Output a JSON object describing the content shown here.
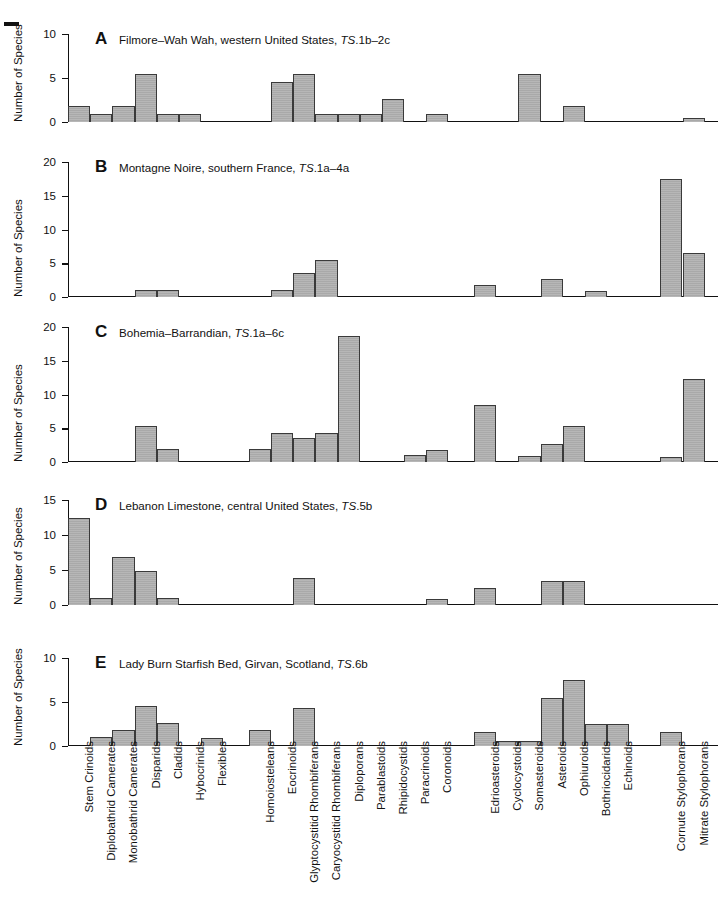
{
  "figure": {
    "axis_label": "Number of Species",
    "bar_color": "#a9a9a9",
    "bar_border_color": "#3a3a3a",
    "axis_color": "#111111"
  },
  "categories": [
    "Stem Crinoids",
    "Diplobathrid Camerates",
    "Monobathrid Camerates",
    "Disparids",
    "Cladids",
    "Hybocrinids",
    "Flexibles",
    "Homoiosteleans",
    "Eocrinoids",
    "Glyptocystitid Rhombiferans",
    "Caryocystitid Rhombiferans",
    "Diploporans",
    "Parablastoids",
    "Rhipidocystids",
    "Paracrinoids",
    "Coronoids",
    "Edrioasteroids",
    "Cyclocystoids",
    "Somasteroids",
    "Asteroids",
    "Ophiuroids",
    "Bothriocidarids",
    "Echinoids",
    "Cornute Stylophorans",
    "Mitrate Stylophorans"
  ],
  "chart_data": [
    {
      "type": "bar",
      "panel": "A",
      "letter": "A",
      "title": "Filmore–Wah Wah, western United States, ",
      "title_ts": "TS",
      "title_tail": ".1b–2c",
      "ylabel": "Number of Species",
      "ylim": [
        0,
        10
      ],
      "yticks": [
        0,
        5,
        10
      ],
      "categories": [
        "Stem Crinoids",
        "Diplobathrid Camerates",
        "Monobathrid Camerates",
        "Disparids",
        "Cladids",
        "Hybocrinids",
        "Flexibles",
        "Homoiosteleans",
        "Eocrinoids",
        "Glyptocystitid Rhombiferans",
        "Caryocystitid Rhombiferans",
        "Diploporans",
        "Parablastoids",
        "Rhipidocystids",
        "Paracrinoids",
        "Coronoids",
        "Edrioasteroids",
        "Cyclocystoids",
        "Somasteroids",
        "Asteroids",
        "Ophiuroids",
        "Bothriocidarids",
        "Echinoids",
        "Cornute Stylophorans",
        "Mitrate Stylophorans"
      ],
      "values": [
        1.8,
        0.9,
        1.8,
        5.5,
        0.9,
        0.9,
        0,
        0,
        4.6,
        5.5,
        0.9,
        0.9,
        0.9,
        2.6,
        0,
        0.9,
        0,
        0,
        5.4,
        0,
        1.8,
        0,
        0,
        0,
        0.5
      ]
    },
    {
      "type": "bar",
      "panel": "B",
      "letter": "B",
      "title": "Montagne Noire, southern France, ",
      "title_ts": "TS",
      "title_tail": ".1a–4a",
      "ylabel": "Number of Species",
      "ylim": [
        0,
        20
      ],
      "yticks": [
        0,
        5,
        10,
        15,
        20
      ],
      "categories": [
        "Stem Crinoids",
        "Diplobathrid Camerates",
        "Monobathrid Camerates",
        "Disparids",
        "Cladids",
        "Hybocrinids",
        "Flexibles",
        "Homoiosteleans",
        "Eocrinoids",
        "Glyptocystitid Rhombiferans",
        "Caryocystitid Rhombiferans",
        "Diploporans",
        "Parablastoids",
        "Rhipidocystids",
        "Paracrinoids",
        "Coronoids",
        "Edrioasteroids",
        "Cyclocystoids",
        "Somasteroids",
        "Asteroids",
        "Ophiuroids",
        "Bothriocidarids",
        "Echinoids",
        "Cornute Stylophorans",
        "Mitrate Stylophorans"
      ],
      "values": [
        0,
        0,
        0,
        1.0,
        1.0,
        0,
        0,
        0,
        1.0,
        3.6,
        5.5,
        0,
        0,
        0,
        0,
        0,
        1.8,
        0,
        0,
        2.6,
        0,
        0.9,
        0,
        17.5,
        6.5
      ]
    },
    {
      "type": "bar",
      "panel": "C",
      "letter": "C",
      "title": "Bohemia–Barrandian, ",
      "title_ts": "TS",
      "title_tail": ".1a–6c",
      "ylabel": "Number of Species",
      "ylim": [
        0,
        20
      ],
      "yticks": [
        0,
        5,
        10,
        15,
        20
      ],
      "categories": [
        "Stem Crinoids",
        "Diplobathrid Camerates",
        "Monobathrid Camerates",
        "Disparids",
        "Cladids",
        "Hybocrinids",
        "Flexibles",
        "Homoiosteleans",
        "Eocrinoids",
        "Glyptocystitid Rhombiferans",
        "Caryocystitid Rhombiferans",
        "Diploporans",
        "Parablastoids",
        "Rhipidocystids",
        "Paracrinoids",
        "Coronoids",
        "Edrioasteroids",
        "Cyclocystoids",
        "Somasteroids",
        "Asteroids",
        "Ophiuroids",
        "Bothriocidarids",
        "Echinoids",
        "Cornute Stylophorans",
        "Mitrate Stylophorans"
      ],
      "values": [
        0,
        0,
        0,
        5.4,
        2.0,
        0,
        0,
        1.9,
        4.3,
        3.5,
        4.3,
        18.7,
        0,
        0,
        1.0,
        1.8,
        8.5,
        0,
        0.9,
        2.6,
        5.3,
        0,
        0,
        0.8,
        12.3
      ]
    },
    {
      "type": "bar",
      "panel": "D",
      "letter": "D",
      "title": "Lebanon Limestone, central United States, ",
      "title_ts": "TS",
      "title_tail": ".5b",
      "ylabel": "Number of Species",
      "ylim": [
        0,
        15
      ],
      "yticks": [
        0,
        5,
        10,
        15
      ],
      "categories": [
        "Stem Crinoids",
        "Diplobathrid Camerates",
        "Monobathrid Camerates",
        "Disparids",
        "Cladids",
        "Hybocrinids",
        "Flexibles",
        "Homoiosteleans",
        "Eocrinoids",
        "Glyptocystitid Rhombiferans",
        "Caryocystitid Rhombiferans",
        "Diploporans",
        "Parablastoids",
        "Rhipidocystids",
        "Paracrinoids",
        "Coronoids",
        "Edrioasteroids",
        "Cyclocystoids",
        "Somasteroids",
        "Asteroids",
        "Ophiuroids",
        "Bothriocidarids",
        "Echinoids",
        "Cornute Stylophorans",
        "Mitrate Stylophorans"
      ],
      "values": [
        12.5,
        1.0,
        6.8,
        4.8,
        1.0,
        0,
        0,
        0,
        0,
        3.8,
        0,
        0,
        0,
        0,
        0,
        0.8,
        2.5,
        0,
        0,
        3.5,
        3.5,
        0,
        0,
        0,
        0
      ]
    },
    {
      "type": "bar",
      "panel": "E",
      "letter": "E",
      "title": "Lady Burn Starfish Bed, Girvan, Scotland, ",
      "title_ts": "TS",
      "title_tail": ".6b",
      "ylabel": "Number of Species",
      "ylim": [
        0,
        10
      ],
      "yticks": [
        0,
        5,
        10
      ],
      "categories": [
        "Stem Crinoids",
        "Diplobathrid Camerates",
        "Monobathrid Camerates",
        "Disparids",
        "Cladids",
        "Hybocrinids",
        "Flexibles",
        "Homoiosteleans",
        "Eocrinoids",
        "Glyptocystitid Rhombiferans",
        "Caryocystitid Rhombiferans",
        "Diploporans",
        "Parablastoids",
        "Rhipidocystids",
        "Paracrinoids",
        "Coronoids",
        "Edrioasteroids",
        "Cyclocystoids",
        "Somasteroids",
        "Asteroids",
        "Ophiuroids",
        "Bothriocidarids",
        "Echinoids",
        "Cornute Stylophorans",
        "Mitrate Stylophorans"
      ],
      "values": [
        0,
        1.0,
        1.8,
        4.5,
        2.6,
        0,
        0.9,
        1.8,
        0,
        4.3,
        0,
        0,
        0,
        0,
        0,
        0,
        1.6,
        0.6,
        0.6,
        5.5,
        7.5,
        2.5,
        2.5,
        1.6,
        0
      ]
    }
  ]
}
